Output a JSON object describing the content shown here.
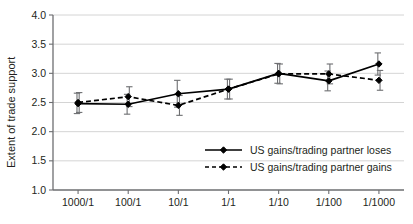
{
  "chart_data": {
    "type": "line",
    "title": "",
    "xlabel": "",
    "ylabel": "Extent of trade support",
    "categories": [
      "1000/1",
      "100/1",
      "10/1",
      "1/1",
      "1/10",
      "1/100",
      "1/1000"
    ],
    "ylim": [
      1.0,
      4.0
    ],
    "yticks": [
      "1.0",
      "1.5",
      "2.0",
      "2.5",
      "3.0",
      "3.5",
      "4.0"
    ],
    "ytick_values": [
      1.0,
      1.5,
      2.0,
      2.5,
      3.0,
      3.5,
      4.0
    ],
    "grid": true,
    "grid_axis": "y",
    "legend_position": "lower right",
    "error_bars": true,
    "series": [
      {
        "name": "US gains/trading partner loses",
        "style": "solid",
        "marker": "filled-diamond",
        "color": "#000000",
        "values": [
          2.48,
          2.47,
          2.65,
          2.73,
          3.0,
          2.87,
          3.16
        ],
        "err_low": [
          2.31,
          2.3,
          2.42,
          2.56,
          2.83,
          2.7,
          2.97
        ],
        "err_high": [
          2.66,
          2.64,
          2.88,
          2.9,
          3.17,
          3.04,
          3.35
        ]
      },
      {
        "name": "US gains/trading partner gains",
        "style": "dashed",
        "marker": "filled-diamond",
        "color": "#000000",
        "values": [
          2.5,
          2.6,
          2.45,
          2.73,
          2.99,
          2.99,
          2.88
        ],
        "err_low": [
          2.33,
          2.43,
          2.28,
          2.56,
          2.82,
          2.82,
          2.71
        ],
        "err_high": [
          2.67,
          2.77,
          2.62,
          2.9,
          3.16,
          3.16,
          3.05
        ]
      }
    ]
  },
  "axis": {
    "y_label": "Extent of trade support"
  },
  "legend": {
    "items": [
      {
        "label": "US gains/trading partner loses",
        "style": "solid"
      },
      {
        "label": "US gains/trading partner gains",
        "style": "dashed"
      }
    ]
  },
  "colors": {
    "line": "#000000",
    "grid": "#c9c9c9",
    "axis": "#6d6e71",
    "text": "#231f20",
    "background": "#ffffff",
    "errorbar": "#6d6e71"
  }
}
